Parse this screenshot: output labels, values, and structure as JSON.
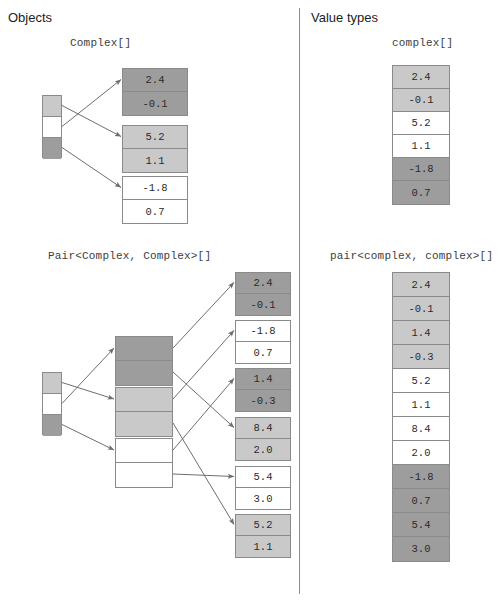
{
  "colors": {
    "dark": "#9d9d9d",
    "mid": "#c9c9c9",
    "light": "#ffffff",
    "border": "#8a8a8a",
    "arrow": "#6e6e6e",
    "divider": "#8d8d8d",
    "heading_text": "#1d1d1d",
    "mono_text": "#2b2b2b"
  },
  "columns": {
    "objects": {
      "heading": "Objects"
    },
    "values": {
      "heading": "Value types"
    }
  },
  "objects_complex": {
    "type_label": "Complex[]",
    "reference_array": {
      "slots": [
        {
          "shade": "mid"
        },
        {
          "shade": "light"
        },
        {
          "shade": "dark"
        }
      ]
    },
    "heap_objects": [
      {
        "shade": "dark",
        "fields": [
          "2.4",
          "-0.1"
        ]
      },
      {
        "shade": "mid",
        "fields": [
          "5.2",
          "1.1"
        ]
      },
      {
        "shade": "light",
        "fields": [
          "-1.8",
          "0.7"
        ]
      }
    ],
    "links": [
      {
        "from_slot": 0,
        "to_object": 1
      },
      {
        "from_slot": 1,
        "to_object": 0
      },
      {
        "from_slot": 2,
        "to_object": 2
      }
    ]
  },
  "objects_pair": {
    "type_label": "Pair<Complex, Complex>[]",
    "reference_array": {
      "slots": [
        {
          "shade": "mid"
        },
        {
          "shade": "light"
        },
        {
          "shade": "dark"
        }
      ]
    },
    "pair_objects": [
      {
        "shade": "dark",
        "fields": [
          "",
          ""
        ]
      },
      {
        "shade": "mid",
        "fields": [
          "",
          ""
        ]
      },
      {
        "shade": "light",
        "fields": [
          "",
          ""
        ]
      }
    ],
    "heap_objects": [
      {
        "shade": "dark",
        "fields": [
          "2.4",
          "-0.1"
        ]
      },
      {
        "shade": "light",
        "fields": [
          "-1.8",
          "0.7"
        ]
      },
      {
        "shade": "dark",
        "fields": [
          "1.4",
          "-0.3"
        ]
      },
      {
        "shade": "mid",
        "fields": [
          "8.4",
          "2.0"
        ]
      },
      {
        "shade": "light",
        "fields": [
          "5.4",
          "3.0"
        ]
      },
      {
        "shade": "mid",
        "fields": [
          "5.2",
          "1.1"
        ]
      }
    ],
    "links_ref_to_pair": [
      {
        "from_slot": 0,
        "to_pair": 1
      },
      {
        "from_slot": 1,
        "to_pair": 0
      },
      {
        "from_slot": 2,
        "to_pair": 2
      }
    ],
    "links_pair_to_heap": [
      {
        "from_pair": 0,
        "from_field": 0,
        "to_object": 0
      },
      {
        "from_pair": 0,
        "from_field": 1,
        "to_object": 3
      },
      {
        "from_pair": 1,
        "from_field": 0,
        "to_object": 1
      },
      {
        "from_pair": 1,
        "from_field": 1,
        "to_object": 5
      },
      {
        "from_pair": 2,
        "from_field": 0,
        "to_object": 2
      },
      {
        "from_pair": 2,
        "from_field": 1,
        "to_object": 4
      }
    ]
  },
  "values_complex": {
    "type_label": "complex[]",
    "cells": [
      {
        "shade": "mid",
        "value": "2.4"
      },
      {
        "shade": "mid",
        "value": "-0.1"
      },
      {
        "shade": "light",
        "value": "5.2"
      },
      {
        "shade": "light",
        "value": "1.1"
      },
      {
        "shade": "dark",
        "value": "-1.8"
      },
      {
        "shade": "dark",
        "value": "0.7"
      }
    ]
  },
  "values_pair": {
    "type_label": "pair<complex, complex>[]",
    "cells": [
      {
        "shade": "mid",
        "value": "2.4"
      },
      {
        "shade": "mid",
        "value": "-0.1"
      },
      {
        "shade": "mid",
        "value": "1.4"
      },
      {
        "shade": "mid",
        "value": "-0.3"
      },
      {
        "shade": "light",
        "value": "5.2"
      },
      {
        "shade": "light",
        "value": "1.1"
      },
      {
        "shade": "light",
        "value": "8.4"
      },
      {
        "shade": "light",
        "value": "2.0"
      },
      {
        "shade": "dark",
        "value": "-1.8"
      },
      {
        "shade": "dark",
        "value": "0.7"
      },
      {
        "shade": "dark",
        "value": "5.4"
      },
      {
        "shade": "dark",
        "value": "3.0"
      }
    ]
  }
}
